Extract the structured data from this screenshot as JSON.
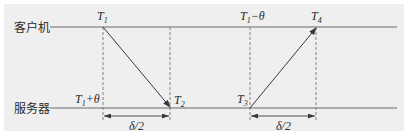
{
  "diagram": {
    "actors": {
      "client": {
        "label": "客户机"
      },
      "server": {
        "label": "服务器"
      }
    },
    "events": {
      "t1": {
        "var": "T",
        "sub": "1",
        "suffix": ""
      },
      "t2": {
        "var": "T",
        "sub": "2",
        "suffix": ""
      },
      "t3": {
        "var": "T",
        "sub": "3",
        "suffix": ""
      },
      "t4": {
        "var": "T",
        "sub": "4",
        "suffix": ""
      },
      "t1_minus_theta": {
        "var": "T",
        "sub": "1",
        "suffix": "−θ"
      },
      "t1_plus_theta": {
        "var": "T",
        "sub": "1",
        "suffix": "+θ"
      }
    },
    "intervals": [
      {
        "label": "δ/2",
        "from": "T1",
        "to": "T2"
      },
      {
        "label": "δ/2",
        "from": "T3",
        "to": "T4"
      }
    ],
    "messages": [
      {
        "from": "client T1",
        "to": "server T2"
      },
      {
        "from": "server T3",
        "to": "client T4"
      }
    ]
  }
}
